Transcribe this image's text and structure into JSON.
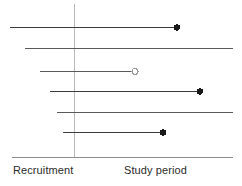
{
  "chart_data": {
    "type": "bar",
    "title": "",
    "subtitle": "",
    "xlabel": "",
    "ylabel": "",
    "orientation": "horizontal",
    "grid": false,
    "legend": false,
    "axis": {
      "x_axis_y": 157,
      "x_axis_start": 12,
      "x_axis_end": 233,
      "divider_x": 74,
      "divider_y_start": 4,
      "divider_y_end": 157,
      "xlim": [
        12,
        233
      ]
    },
    "categories": [
      "participant-1",
      "participant-2",
      "participant-3",
      "participant-4",
      "participant-5",
      "participant-6"
    ],
    "series": [
      {
        "name": "Follow-up duration",
        "values": [
          167,
          208,
          95,
          150,
          176,
          101
        ]
      }
    ],
    "annotations": [
      {
        "label": "Recruitment",
        "x": 13,
        "y": 164
      },
      {
        "label": "Study period",
        "x": 124,
        "y": 164
      }
    ],
    "rows": [
      {
        "id": "row-1",
        "y": 27,
        "start": 10,
        "end": 177,
        "marker": "filled-dot",
        "marker_label": "event",
        "line_color": "#3b3b3b",
        "line_width": 1.3
      },
      {
        "id": "row-2",
        "y": 48,
        "start": 25,
        "end": 233,
        "marker": "none",
        "marker_label": "censored",
        "line_color": "#5a5a5a",
        "line_width": 1.3
      },
      {
        "id": "row-3",
        "y": 71,
        "start": 40,
        "end": 135,
        "marker": "open-dot",
        "marker_label": "withdrawal",
        "line_color": "#5a5a5a",
        "line_width": 1.2
      },
      {
        "id": "row-4",
        "y": 91,
        "start": 50,
        "end": 200,
        "marker": "filled-dot",
        "marker_label": "event",
        "line_color": "#3b3b3b",
        "line_width": 1.3
      },
      {
        "id": "row-5",
        "y": 112,
        "start": 57,
        "end": 233,
        "marker": "none",
        "marker_label": "censored",
        "line_color": "#5a5a5a",
        "line_width": 1.2
      },
      {
        "id": "row-6",
        "y": 132,
        "start": 63,
        "end": 163,
        "marker": "filled-dot",
        "marker_label": "event",
        "line_color": "#3b3b3b",
        "line_width": 1.4
      }
    ]
  },
  "labels": {
    "recruitment": "Recruitment",
    "study_period": "Study period"
  },
  "colors": {
    "line_dark": "#3b3b3b",
    "line_mid": "#5a5a5a",
    "axis": "#8d8d8d",
    "divider": "#b9b9b9",
    "marker_fill": "#1a1a1a",
    "marker_open_fill": "#ffffff",
    "marker_open_stroke": "#9a9a9a",
    "text": "#2b2b2b",
    "background": "#ffffff"
  }
}
